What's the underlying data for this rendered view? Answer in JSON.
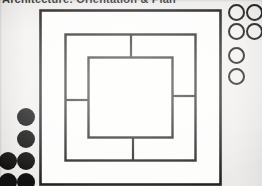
{
  "page": {
    "width": 262,
    "height": 186,
    "background_color": "#f2f1ef",
    "ink_color": "#232323",
    "fill_color": "#111111"
  },
  "header": {
    "text": "Architecture: Orientation & Plan",
    "clipped": "true"
  },
  "diagram": {
    "type": "nested-squares-pinwheel",
    "stroke_color": "#232323",
    "fill_color": "#ffffff",
    "outer_border": {
      "name": "outer-frame",
      "x": 1,
      "y": 1,
      "width": 181,
      "height": 175
    },
    "middle_border": {
      "name": "middle-band",
      "x": 26,
      "y": 25,
      "width": 131,
      "height": 127
    },
    "inner_border": {
      "name": "inner-square",
      "x": 49,
      "y": 48,
      "width": 85,
      "height": 81
    },
    "dividers": [
      {
        "name": "top-band-divider",
        "orientation": "vertical",
        "x1": 92,
        "y1": 25,
        "x2": 92,
        "y2": 48
      },
      {
        "name": "left-band-divider",
        "orientation": "horizontal",
        "x1": 26,
        "y1": 91,
        "x2": 49,
        "y2": 91
      },
      {
        "name": "right-band-divider",
        "orientation": "horizontal",
        "x1": 134,
        "y1": 87,
        "x2": 157,
        "y2": 87
      },
      {
        "name": "bottom-band-divider",
        "orientation": "vertical",
        "x1": 94,
        "y1": 129,
        "x2": 94,
        "y2": 152
      }
    ]
  },
  "right_margin_circles": {
    "name": "open-circle-marks",
    "style": "outline",
    "count": 6,
    "radius": 8,
    "items": [
      {
        "cx": 10,
        "cy": 10
      },
      {
        "cx": 28,
        "cy": 10
      },
      {
        "cx": 10,
        "cy": 29
      },
      {
        "cx": 28,
        "cy": 29
      },
      {
        "cx": 10,
        "cy": 53
      },
      {
        "cx": 10,
        "cy": 74
      }
    ]
  },
  "left_margin_circles": {
    "name": "filled-circle-marks",
    "style": "filled",
    "count": 6,
    "radius": 9,
    "items": [
      {
        "cx": 26,
        "cy": 9
      },
      {
        "cx": 26,
        "cy": 31
      },
      {
        "cx": 8,
        "cy": 53
      },
      {
        "cx": 26,
        "cy": 53
      },
      {
        "cx": 8,
        "cy": 74
      },
      {
        "cx": 26,
        "cy": 74
      }
    ]
  }
}
